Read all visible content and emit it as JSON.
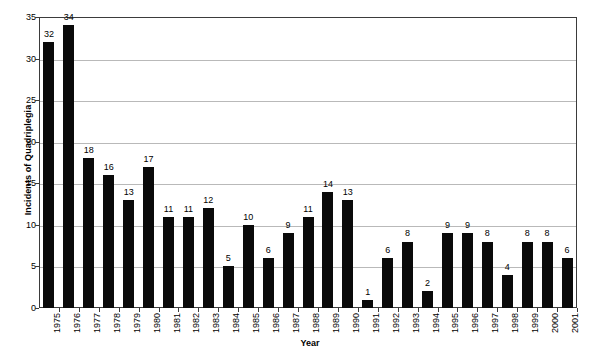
{
  "chart_data": {
    "type": "bar",
    "title": "",
    "xlabel": "Year",
    "ylabel": "Incidents of Quadriplegia",
    "categories": [
      "1975",
      "1976",
      "1977",
      "1978",
      "1979",
      "1980",
      "1981",
      "1982",
      "1983",
      "1984",
      "1985",
      "1986",
      "1987",
      "1988",
      "1989",
      "1990",
      "1991",
      "1992",
      "1993",
      "1994",
      "1995",
      "1996",
      "1997",
      "1998",
      "1999",
      "2000",
      "2001"
    ],
    "values": [
      32,
      34,
      18,
      16,
      13,
      17,
      11,
      11,
      12,
      5,
      10,
      6,
      9,
      11,
      14,
      13,
      1,
      6,
      8,
      2,
      9,
      9,
      8,
      4,
      8,
      8,
      6
    ],
    "ylim": [
      0,
      35
    ],
    "ytick_labels": [
      "0",
      "5",
      "10",
      "15",
      "20",
      "25",
      "30",
      "35"
    ],
    "ytick_values": [
      0,
      5,
      10,
      15,
      20,
      25,
      30,
      35
    ],
    "grid": true,
    "legend": false,
    "data_labels": true,
    "bar_color": "#0a0a0a",
    "grid_color": "#b9b9b9",
    "frame_color": "#3b3b3b",
    "background": "#ffffff"
  }
}
